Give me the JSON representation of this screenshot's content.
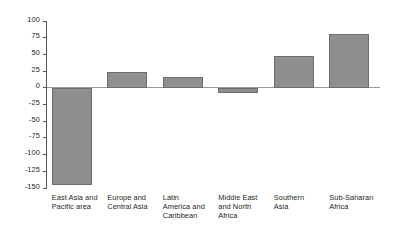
{
  "chart_data": {
    "type": "bar",
    "title": "",
    "subtitle": "",
    "xlabel": "",
    "ylabel": "",
    "categories": [
      "East Asia and\nPacific area",
      "Europe and\nCentral Asia",
      "Latin\nAmerica and\nCaribbean",
      "Middle East\nand North\nAfrica",
      "Southern\nAsia",
      "Sub-Saharan\nAfrica"
    ],
    "values": [
      -145,
      23,
      16,
      -8,
      47,
      81
    ],
    "ylim": [
      -150,
      100
    ],
    "yticks": [
      100,
      75,
      50,
      25,
      0,
      -25,
      -50,
      -75,
      -100,
      -125,
      -150
    ],
    "ytick_labels": [
      "100",
      "75",
      "50",
      "25",
      "0",
      "-25",
      "-50",
      "-75",
      "-100",
      "-125",
      "-150"
    ],
    "grid": false,
    "legend": null,
    "bar_color": "#8f8f8f",
    "bar_border_color": "#6d6d6d",
    "axis_color": "#58585a",
    "zero_line_color": "#9a9a9c"
  }
}
